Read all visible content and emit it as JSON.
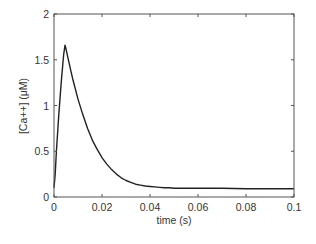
{
  "chart_data": {
    "type": "line",
    "title": "",
    "xlabel": "time (s)",
    "ylabel": "[Ca++] (μM)",
    "xlim": [
      0,
      0.1
    ],
    "ylim": [
      0,
      2
    ],
    "xticks": [
      "0",
      "0.02",
      "0.04",
      "0.06",
      "0.08",
      "0.1"
    ],
    "yticks": [
      "0",
      "0.5",
      "1",
      "1.5",
      "2"
    ],
    "grid": false,
    "legend": null,
    "series": [
      {
        "name": "[Ca++]",
        "color": "#222222",
        "x": [
          0,
          0.0005,
          0.001,
          0.002,
          0.003,
          0.004,
          0.0046,
          0.005,
          0.006,
          0.007,
          0.008,
          0.01,
          0.012,
          0.014,
          0.016,
          0.018,
          0.02,
          0.022,
          0.024,
          0.026,
          0.028,
          0.03,
          0.032,
          0.034,
          0.036,
          0.038,
          0.04,
          0.042,
          0.044,
          0.046,
          0.048,
          0.05,
          0.06,
          0.07,
          0.08,
          0.09,
          0.1
        ],
        "values": [
          0.1,
          0.25,
          0.5,
          0.9,
          1.25,
          1.55,
          1.66,
          1.62,
          1.5,
          1.38,
          1.27,
          1.07,
          0.9,
          0.75,
          0.62,
          0.52,
          0.43,
          0.36,
          0.3,
          0.25,
          0.21,
          0.18,
          0.16,
          0.14,
          0.13,
          0.12,
          0.115,
          0.11,
          0.105,
          0.1,
          0.1,
          0.095,
          0.095,
          0.095,
          0.09,
          0.09,
          0.09
        ]
      }
    ]
  }
}
